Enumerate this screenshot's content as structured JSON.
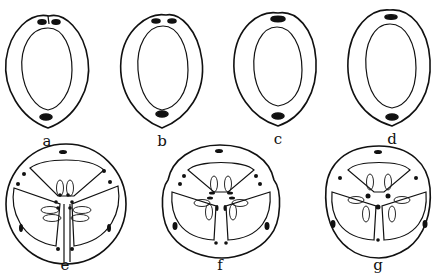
{
  "figure": {
    "ink_color": "#111111",
    "background": "#ffffff",
    "panels": [
      {
        "label": "a",
        "type": "single-carpel",
        "top_bundles": 2,
        "notch": true,
        "bottom_bundles": 1
      },
      {
        "label": "b",
        "type": "single-carpel",
        "top_bundles": 2,
        "notch": true,
        "bottom_bundles": 1
      },
      {
        "label": "c",
        "type": "single-carpel",
        "top_bundles": 1,
        "notch": true,
        "bottom_bundles": 1
      },
      {
        "label": "d",
        "type": "single-carpel",
        "top_bundles": 1,
        "notch": false,
        "bottom_bundles": 1
      },
      {
        "label": "e",
        "type": "tricarpellate",
        "locules": 3,
        "ovules_visible": true
      },
      {
        "label": "f",
        "type": "tricarpellate",
        "locules": 3,
        "ovules_visible": true
      },
      {
        "label": "g",
        "type": "tricarpellate",
        "locules": 3,
        "ovules_visible": true
      }
    ]
  }
}
